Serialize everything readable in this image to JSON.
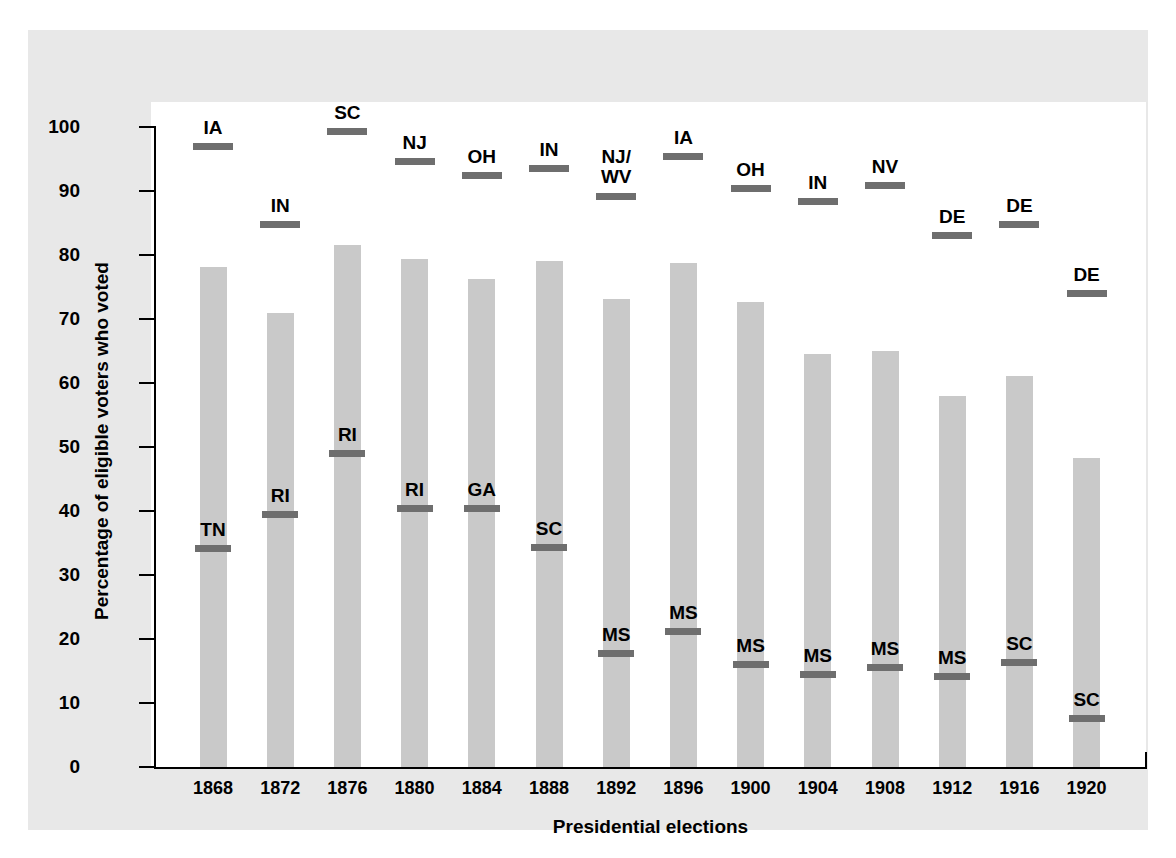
{
  "chart_data": {
    "type": "bar",
    "title": "",
    "xlabel": "Presidential elections",
    "ylabel": "Percentage of eligible voters who voted",
    "ylim": [
      0,
      100
    ],
    "yticks": [
      0,
      10,
      20,
      30,
      40,
      50,
      60,
      70,
      80,
      90,
      100
    ],
    "grid": false,
    "legend": "none",
    "categories": [
      "1868",
      "1872",
      "1876",
      "1880",
      "1884",
      "1888",
      "1892",
      "1896",
      "1900",
      "1904",
      "1908",
      "1912",
      "1916",
      "1920"
    ],
    "values": [
      78.1,
      71.0,
      81.5,
      79.3,
      76.3,
      79.0,
      73.2,
      78.7,
      72.7,
      64.6,
      65.0,
      58.0,
      61.1,
      48.3
    ],
    "series": [
      {
        "name": "National turnout",
        "values": [
          78.1,
          71.0,
          81.5,
          79.3,
          76.3,
          79.0,
          73.2,
          78.7,
          72.7,
          64.6,
          65.0,
          58.0,
          61.1,
          48.3
        ]
      },
      {
        "name": "Highest state turnout",
        "values": [
          97.0,
          84.8,
          99.3,
          94.7,
          92.5,
          93.6,
          89.2,
          95.5,
          90.5,
          88.4,
          91.0,
          83.2,
          84.9,
          74.1
        ],
        "state_labels": [
          "IA",
          "IN",
          "SC",
          "NJ",
          "OH",
          "IN",
          "NJ/\nWV",
          "IA",
          "OH",
          "IN",
          "NV",
          "DE",
          "DE",
          "DE"
        ]
      },
      {
        "name": "Lowest state turnout",
        "values": [
          34.2,
          39.6,
          49.0,
          40.5,
          40.5,
          34.3,
          17.8,
          21.3,
          16.1,
          14.5,
          15.6,
          14.2,
          16.4,
          7.6
        ],
        "state_labels": [
          "TN",
          "RI",
          "RI",
          "RI",
          "GA",
          "SC",
          "MS",
          "MS",
          "MS",
          "MS",
          "MS",
          "MS",
          "SC",
          "SC"
        ]
      }
    ],
    "colors": {
      "bar": "#c9c9c9",
      "marker": "#6e6e6e",
      "panel": "#e8e8e8",
      "plot_background": "#ffffff",
      "axis": "#000000"
    }
  }
}
